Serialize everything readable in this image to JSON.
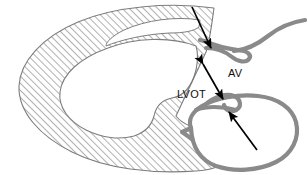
{
  "figure": {
    "width": 308,
    "height": 175,
    "background_color": "#ffffff"
  },
  "colors": {
    "hatch_line": "#9a9a9a",
    "hatch_outline": "#7d7d7d",
    "valve_gray": "#8a8a8a",
    "arrow_black": "#000000",
    "label_text": "#111111",
    "cavity_fill": "#ffffff"
  },
  "labels": [
    {
      "id": "av-label",
      "text": "AV",
      "meaning": "aortic valve",
      "x": 228,
      "y": 77
    },
    {
      "id": "lvot-label",
      "text": "LVOT",
      "meaning": "left ventricular outflow tract",
      "x": 177,
      "y": 98
    }
  ],
  "annotations": [
    {
      "id": "upper-leaflet-arrow",
      "type": "single-headed-arrow",
      "points_to": "anterior aortic valve leaflet hinge",
      "from": [
        192,
        7
      ],
      "to": [
        212,
        49
      ]
    },
    {
      "id": "lvot-measure-arrow",
      "type": "double-headed-arrow",
      "measures": "LVOT diameter",
      "from": [
        203,
        64
      ],
      "to": [
        223,
        99
      ]
    },
    {
      "id": "lower-leaflet-arrow",
      "type": "single-headed-arrow",
      "points_to": "posterior aortic valve leaflet / sinus hinge",
      "from": [
        257,
        150
      ],
      "to": [
        228,
        111
      ]
    }
  ],
  "structures": [
    {
      "id": "left-ventricle-myocardium",
      "name": "left ventricular myocardium",
      "fill": "diagonal-hatch",
      "outline": "#7d7d7d"
    },
    {
      "id": "left-ventricle-cavity",
      "name": "left ventricular cavity",
      "fill": "#ffffff"
    },
    {
      "id": "anterior-aortic-leaflet",
      "name": "anterior aortic valve leaflet",
      "stroke": "#8a8a8a"
    },
    {
      "id": "aortic-root-sinus",
      "name": "aortic root and sinus of Valsalva",
      "stroke": "#8a8a8a"
    },
    {
      "id": "posterior-aortic-leaflet",
      "name": "posterior aortic valve leaflet",
      "stroke": "#8a8a8a"
    }
  ]
}
